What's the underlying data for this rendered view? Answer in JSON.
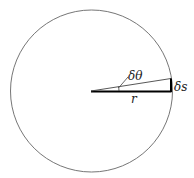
{
  "diagram": {
    "labels": {
      "angle": "δθ",
      "radius": "r",
      "arc": "δs"
    },
    "colors": {
      "stroke": "#555555",
      "thick": "#000000",
      "background": "#ffffff"
    },
    "circle": {
      "cx": 91.5,
      "cy": 91,
      "r": 81
    }
  }
}
